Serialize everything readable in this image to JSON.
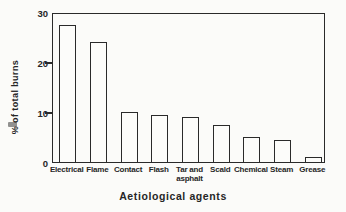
{
  "figure": {
    "ink_color": "#2a2a2a",
    "paper_color": "#fbfbf9",
    "bar_fill": "#fcfcfa"
  },
  "chart_data": {
    "type": "bar",
    "title": "",
    "xlabel": "Aetiological agents",
    "ylabel": "% of total burns",
    "categories": [
      "Electrical",
      "Flame",
      "Contact",
      "Flash",
      "Tar and\nasphalt",
      "Scald",
      "Chemical",
      "Steam",
      "Grease"
    ],
    "values": [
      27.5,
      24,
      10,
      9.5,
      9,
      7.5,
      5,
      4.5,
      1
    ],
    "ylim": [
      0,
      30
    ],
    "yticks": [
      0,
      10,
      20,
      30
    ],
    "grid": false,
    "legend_position": "none",
    "bar_style": "outlined-unfilled",
    "frame": "full-box"
  }
}
